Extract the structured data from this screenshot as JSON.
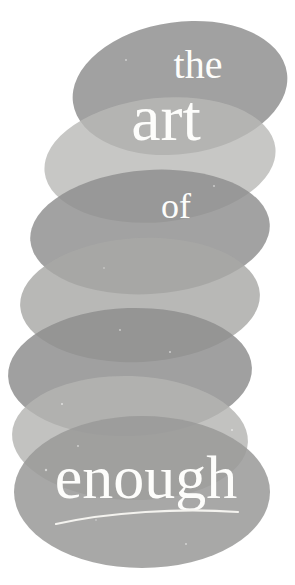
{
  "cover": {
    "kind": "book-cover",
    "background_color": "#ffffff",
    "text_color": "#fdfdfb",
    "title_lines": [
      {
        "id": "line-the",
        "text": "the",
        "x": 198,
        "y": 78,
        "size": 40
      },
      {
        "id": "line-art",
        "text": "art",
        "x": 166,
        "y": 140,
        "size": 66
      },
      {
        "id": "line-of",
        "text": "of",
        "x": 176,
        "y": 218,
        "size": 36
      },
      {
        "id": "line-enough",
        "text": "enough",
        "x": 146,
        "y": 498,
        "size": 62
      }
    ],
    "underline": {
      "id": "title-underline",
      "color": "#f4f3ef",
      "path": "M 56 524 C 110 512, 180 508, 238 512",
      "width": 2.2
    },
    "ellipses": [
      {
        "id": "ellipse-1",
        "cx": 180,
        "cy": 88,
        "rx": 108,
        "ry": 66,
        "rot": -8,
        "color": "#8c8c8c",
        "opacity": 0.82
      },
      {
        "id": "ellipse-2",
        "cx": 160,
        "cy": 160,
        "rx": 116,
        "ry": 62,
        "rot": -6,
        "color": "#b9b9b7",
        "opacity": 0.8
      },
      {
        "id": "ellipse-3",
        "cx": 150,
        "cy": 232,
        "rx": 120,
        "ry": 62,
        "rot": -4,
        "color": "#8e8e8e",
        "opacity": 0.82
      },
      {
        "id": "ellipse-4",
        "cx": 140,
        "cy": 300,
        "rx": 120,
        "ry": 62,
        "rot": -3,
        "color": "#a8a8a6",
        "opacity": 0.82
      },
      {
        "id": "ellipse-5",
        "cx": 130,
        "cy": 372,
        "rx": 122,
        "ry": 64,
        "rot": -2,
        "color": "#8e8e8e",
        "opacity": 0.84
      },
      {
        "id": "ellipse-6",
        "cx": 130,
        "cy": 438,
        "rx": 118,
        "ry": 62,
        "rot": 2,
        "color": "#b4b4b2",
        "opacity": 0.82
      },
      {
        "id": "ellipse-7",
        "cx": 142,
        "cy": 492,
        "rx": 128,
        "ry": 76,
        "rot": 0,
        "color": "#9a9a98",
        "opacity": 0.86
      }
    ],
    "speckles": [
      {
        "cx": 62,
        "cy": 404,
        "r": 1.1
      },
      {
        "cx": 78,
        "cy": 446,
        "r": 0.9
      },
      {
        "cx": 46,
        "cy": 470,
        "r": 1.2
      },
      {
        "cx": 120,
        "cy": 330,
        "r": 0.9
      },
      {
        "cx": 170,
        "cy": 352,
        "r": 1.0
      },
      {
        "cx": 104,
        "cy": 268,
        "r": 0.8
      },
      {
        "cx": 214,
        "cy": 186,
        "r": 0.9
      },
      {
        "cx": 126,
        "cy": 60,
        "r": 0.9
      },
      {
        "cx": 232,
        "cy": 430,
        "r": 1.0
      },
      {
        "cx": 186,
        "cy": 544,
        "r": 0.9
      },
      {
        "cx": 96,
        "cy": 520,
        "r": 0.8
      },
      {
        "cx": 150,
        "cy": 110,
        "r": 0.8
      }
    ]
  }
}
